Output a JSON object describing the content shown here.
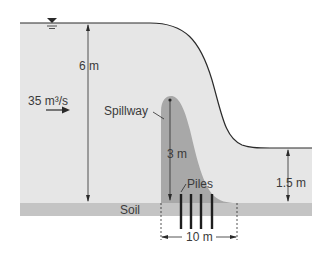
{
  "diagram": {
    "labels": {
      "upstream_depth": "6 m",
      "flow_rate": "35 m³/s",
      "spillway": "Spillway",
      "spillway_height": "3 m",
      "piles": "Piles",
      "downstream_depth": "1.5 m",
      "soil": "Soil",
      "base_width": "10 m"
    },
    "colors": {
      "water": "#e6e6e6",
      "spillway": "#a8a8a8",
      "soil": "#c4c4c4",
      "line": "#2a2a2a"
    }
  }
}
